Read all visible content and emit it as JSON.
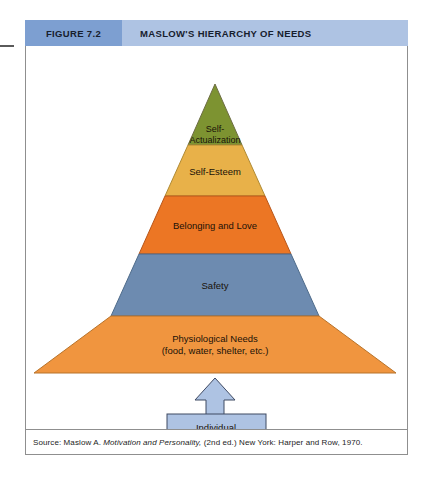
{
  "figure": {
    "number_label": "FIGURE 7.2",
    "title": "MASLOW'S HIERARCHY OF NEEDS",
    "header_number_bg": "#7d9fd1",
    "header_title_bg": "#aec3e3"
  },
  "pyramid": {
    "tiers": [
      {
        "id": "self-actualization",
        "label_line1": "Self-",
        "label_line2": "Actualization",
        "color": "#7d9331",
        "rank": 5
      },
      {
        "id": "self-esteem",
        "label_line1": "Self-Esteem",
        "label_line2": "",
        "color": "#e8b149",
        "rank": 4
      },
      {
        "id": "belonging-and-love",
        "label_line1": "Belonging and Love",
        "label_line2": "",
        "color": "#ec7624",
        "rank": 3
      },
      {
        "id": "safety",
        "label_line1": "Safety",
        "label_line2": "",
        "color": "#6d8bb0",
        "rank": 2
      },
      {
        "id": "physiological-needs",
        "label_line1": "Physiological Needs",
        "label_line2": "(food, water, shelter, etc.)",
        "color": "#f0953f",
        "rank": 1
      }
    ]
  },
  "individual": {
    "label": "Individual",
    "box_fill": "#aec3e3",
    "arrow_fill": "#aec3e3",
    "stroke": "#3f4a63"
  },
  "source": {
    "prefix": "Source: Maslow A. ",
    "italic_part": "Motivation and Personality,",
    "suffix": " (2nd ed.) New York: Harper and Row, 1970."
  }
}
